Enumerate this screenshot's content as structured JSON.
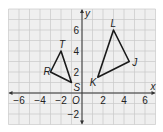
{
  "diagram": {
    "type": "coordinate-plane",
    "origin_px": [
      82,
      93
    ],
    "unit_px": 10.5,
    "grid": {
      "xmin": -7,
      "xmax": 7,
      "ymin": -3,
      "ymax": 8,
      "color": "#c8c8c8",
      "background": "#efefef"
    },
    "axes": {
      "x_label": "x",
      "y_label": "y",
      "origin_label": "O",
      "x_ticks": [
        {
          "value": -6,
          "label": "−6"
        },
        {
          "value": -4,
          "label": "−4"
        },
        {
          "value": -2,
          "label": "−2"
        },
        {
          "value": 2,
          "label": "2"
        },
        {
          "value": 4,
          "label": "4"
        },
        {
          "value": 6,
          "label": "6"
        }
      ],
      "y_ticks": [
        {
          "value": 6,
          "label": "6"
        },
        {
          "value": 4,
          "label": "4"
        },
        {
          "value": 2,
          "label": "2"
        },
        {
          "value": -2,
          "label": "−2"
        }
      ],
      "color": "#333333"
    },
    "triangles": [
      {
        "name": "RST",
        "color": "#1a1a1a",
        "vertices": [
          {
            "label": "R",
            "x": -3,
            "y": 2,
            "label_dx": -7,
            "label_dy": 3
          },
          {
            "label": "S",
            "x": -1,
            "y": 1,
            "label_dx": 2,
            "label_dy": 8
          },
          {
            "label": "T",
            "x": -2,
            "y": 4,
            "label_dx": -2,
            "label_dy": -3
          }
        ]
      },
      {
        "name": "JKL",
        "color": "#1a1a1a",
        "vertices": [
          {
            "label": "J",
            "x": 4.5,
            "y": 3,
            "label_dx": 3,
            "label_dy": 4
          },
          {
            "label": "K",
            "x": 1.5,
            "y": 1.5,
            "label_dx": -8,
            "label_dy": 9
          },
          {
            "label": "L",
            "x": 3,
            "y": 6,
            "label_dx": -3,
            "label_dy": -3
          }
        ]
      }
    ]
  }
}
